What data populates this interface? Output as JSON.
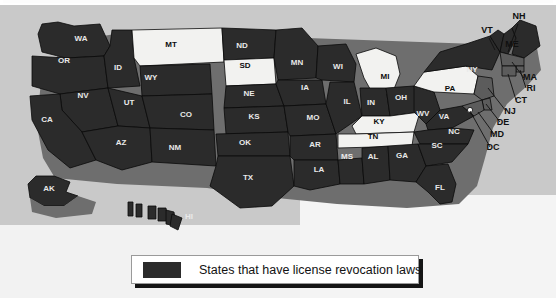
{
  "figure": {
    "title": "",
    "background_color": "#c9c9c9",
    "panel_color": "#f2f2f2"
  },
  "legend": {
    "label": "States that have license revocation laws",
    "swatch_color": "#2b2b2b",
    "box_background": "#ffffff",
    "box_border": "#9a9a9a",
    "shadow_color": "#151515"
  },
  "colors": {
    "has_law": "#2b2b2b",
    "no_law": "#f2f2f0",
    "shadow": "#6e6e6e",
    "border": "#0a0a0a",
    "label_on_dark": "#e9e9e9",
    "label_on_light": "#0c0c0c"
  },
  "chart_data": {
    "type": "map",
    "title": "States that have license revocation laws",
    "subtype": "choropleth-binary",
    "region": "United States",
    "legend_entries": [
      {
        "label": "States that have license revocation laws",
        "color": "#2b2b2b",
        "value": 1
      }
    ],
    "categories": [
      "has license revocation laws",
      "does not have license revocation laws"
    ],
    "values": [
      45,
      6
    ],
    "counts": {
      "has_law": 45,
      "no_law": 6
    },
    "no_law_states": [
      "MT",
      "SD",
      "MI",
      "PA",
      "KY",
      "TN"
    ],
    "states": [
      {
        "code": "WA",
        "name": "Washington",
        "has_law": true,
        "label_x": 81,
        "label_y": 41
      },
      {
        "code": "OR",
        "name": "Oregon",
        "has_law": true,
        "label_x": 64,
        "label_y": 63
      },
      {
        "code": "ID",
        "name": "Idaho",
        "has_law": true,
        "label_x": 118,
        "label_y": 70
      },
      {
        "code": "MT",
        "name": "Montana",
        "has_law": false,
        "label_x": 171,
        "label_y": 47
      },
      {
        "code": "WY",
        "name": "Wyoming",
        "has_law": true,
        "label_x": 151,
        "label_y": 80
      },
      {
        "code": "ND",
        "name": "North Dakota",
        "has_law": true,
        "label_x": 242,
        "label_y": 48
      },
      {
        "code": "SD",
        "name": "South Dakota",
        "has_law": false,
        "label_x": 245,
        "label_y": 68
      },
      {
        "code": "NE",
        "name": "Nebraska",
        "has_law": true,
        "label_x": 249,
        "label_y": 96
      },
      {
        "code": "NV",
        "name": "Nevada",
        "has_law": true,
        "label_x": 83,
        "label_y": 98
      },
      {
        "code": "UT",
        "name": "Utah",
        "has_law": true,
        "label_x": 129,
        "label_y": 105
      },
      {
        "code": "CO",
        "name": "Colorado",
        "has_law": true,
        "label_x": 186,
        "label_y": 117
      },
      {
        "code": "CA",
        "name": "California",
        "has_law": true,
        "label_x": 47,
        "label_y": 122
      },
      {
        "code": "AZ",
        "name": "Arizona",
        "has_law": true,
        "label_x": 121,
        "label_y": 145
      },
      {
        "code": "NM",
        "name": "New Mexico",
        "has_law": true,
        "label_x": 175,
        "label_y": 150
      },
      {
        "code": "KS",
        "name": "Kansas",
        "has_law": true,
        "label_x": 254,
        "label_y": 119
      },
      {
        "code": "OK",
        "name": "Oklahoma",
        "has_law": true,
        "label_x": 245,
        "label_y": 145
      },
      {
        "code": "TX",
        "name": "Texas",
        "has_law": true,
        "label_x": 248,
        "label_y": 180
      },
      {
        "code": "MN",
        "name": "Minnesota",
        "has_law": true,
        "label_x": 297,
        "label_y": 65
      },
      {
        "code": "IA",
        "name": "Iowa",
        "has_law": true,
        "label_x": 305,
        "label_y": 90
      },
      {
        "code": "MO",
        "name": "Missouri",
        "has_law": true,
        "label_x": 313,
        "label_y": 120
      },
      {
        "code": "AR",
        "name": "Arkansas",
        "has_law": true,
        "label_x": 315,
        "label_y": 147
      },
      {
        "code": "LA",
        "name": "Louisiana",
        "has_law": true,
        "label_x": 319,
        "label_y": 172
      },
      {
        "code": "WI",
        "name": "Wisconsin",
        "has_law": true,
        "label_x": 338,
        "label_y": 69
      },
      {
        "code": "IL",
        "name": "Illinois",
        "has_law": true,
        "label_x": 347,
        "label_y": 104
      },
      {
        "code": "MS",
        "name": "Mississippi",
        "has_law": true,
        "label_x": 347,
        "label_y": 159
      },
      {
        "code": "MI",
        "name": "Michigan",
        "has_law": false,
        "label_x": 385,
        "label_y": 79
      },
      {
        "code": "IN",
        "name": "Indiana",
        "has_law": true,
        "label_x": 371,
        "label_y": 105
      },
      {
        "code": "KY",
        "name": "Kentucky",
        "has_law": false,
        "label_x": 379,
        "label_y": 124
      },
      {
        "code": "TN",
        "name": "Tennessee",
        "has_law": false,
        "label_x": 373,
        "label_y": 139
      },
      {
        "code": "AL",
        "name": "Alabama",
        "has_law": true,
        "label_x": 373,
        "label_y": 159
      },
      {
        "code": "OH",
        "name": "Ohio",
        "has_law": true,
        "label_x": 401,
        "label_y": 100
      },
      {
        "code": "GA",
        "name": "Georgia",
        "has_law": true,
        "label_x": 402,
        "label_y": 158
      },
      {
        "code": "WV",
        "name": "West Virginia",
        "has_law": true,
        "label_x": 423,
        "label_y": 116
      },
      {
        "code": "VA",
        "name": "Virginia",
        "has_law": true,
        "label_x": 444,
        "label_y": 119
      },
      {
        "code": "NC",
        "name": "North Carolina",
        "has_law": true,
        "label_x": 454,
        "label_y": 134
      },
      {
        "code": "SC",
        "name": "South Carolina",
        "has_law": true,
        "label_x": 437,
        "label_y": 148
      },
      {
        "code": "FL",
        "name": "Florida",
        "has_law": true,
        "label_x": 440,
        "label_y": 190
      },
      {
        "code": "PA",
        "name": "Pennsylvania",
        "has_law": false,
        "label_x": 450,
        "label_y": 91
      },
      {
        "code": "NY",
        "name": "New York",
        "has_law": true,
        "label_x": 472,
        "label_y": 72
      },
      {
        "code": "AK",
        "name": "Alaska",
        "has_law": true,
        "label_x": 49,
        "label_y": 191
      },
      {
        "code": "HI",
        "name": "Hawaii",
        "has_law": true,
        "label_x": 189,
        "label_y": 219
      }
    ],
    "callout_labels": [
      {
        "code": "NH",
        "name": "New Hampshire",
        "has_law": true,
        "label_x": 519,
        "label_y": 19
      },
      {
        "code": "VT",
        "name": "Vermont",
        "has_law": true,
        "label_x": 487,
        "label_y": 33
      },
      {
        "code": "ME",
        "name": "Maine",
        "has_law": true,
        "label_x": 512,
        "label_y": 47
      },
      {
        "code": "MA",
        "name": "Massachusetts",
        "has_law": true,
        "label_x": 530,
        "label_y": 80
      },
      {
        "code": "RI",
        "name": "Rhode Island",
        "has_law": true,
        "label_x": 531,
        "label_y": 91
      },
      {
        "code": "CT",
        "name": "Connecticut",
        "has_law": true,
        "label_x": 521,
        "label_y": 103
      },
      {
        "code": "NJ",
        "name": "New Jersey",
        "has_law": true,
        "label_x": 510,
        "label_y": 114
      },
      {
        "code": "DE",
        "name": "Delaware",
        "has_law": true,
        "label_x": 503,
        "label_y": 125
      },
      {
        "code": "MD",
        "name": "Maryland",
        "has_law": true,
        "label_x": 497,
        "label_y": 137
      },
      {
        "code": "DC",
        "name": "District of Columbia",
        "has_law": true,
        "label_x": 493,
        "label_y": 150
      }
    ]
  }
}
